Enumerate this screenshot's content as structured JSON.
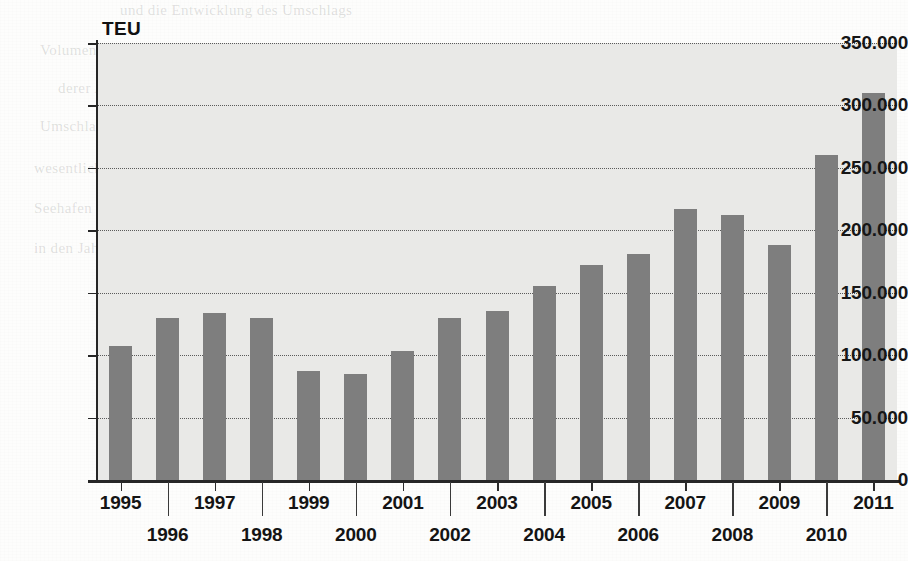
{
  "page": {
    "background_color": "#fdfdfc",
    "ghost_text_lines": [
      "und die Entwicklung des Umschlags",
      "Volumen haben an Bedeutung, und die Umschlagmenge stieg weiter",
      "derer Anteil an dem gesamten relativ zu Veränderungen",
      "Umschlag Hafen Bremen wesentlich gegenüber dem Vorjahr",
      "wesentlichen Anteil an der Zunahme der",
      "Seehafen und die Binnenschifffahrt",
      "in den Jahren"
    ]
  },
  "chart_data": {
    "type": "bar",
    "title": "",
    "subtitle": "",
    "xlabel": "",
    "ylabel": "TEU",
    "unit_label": "TEU",
    "categories": [
      "1995",
      "1996",
      "1997",
      "1998",
      "1999",
      "2000",
      "2001",
      "2002",
      "2003",
      "2004",
      "2005",
      "2006",
      "2007",
      "2008",
      "2009",
      "2010",
      "2011"
    ],
    "values": [
      107000,
      130000,
      134000,
      130000,
      87000,
      85000,
      103000,
      130000,
      135000,
      155000,
      172000,
      181000,
      217000,
      212000,
      188000,
      260000,
      310000
    ],
    "ylim": [
      0,
      350000
    ],
    "ytick_values": [
      0,
      50000,
      100000,
      150000,
      200000,
      250000,
      300000,
      350000
    ],
    "ytick_labels": [
      "0",
      "50.000",
      "100.000",
      "150.000",
      "200.000",
      "250.000",
      "300.000",
      "350.000"
    ],
    "grid": true,
    "grid_style": "dotted",
    "legend": "none",
    "bar_color": "#7e7e7e",
    "plot_background_color": "#e9e9e7",
    "axis_color": "#262626",
    "label_rows": [
      "top",
      "bottom",
      "top",
      "bottom",
      "top",
      "bottom",
      "top",
      "bottom",
      "top",
      "bottom",
      "top",
      "bottom",
      "top",
      "bottom",
      "top",
      "bottom",
      "top"
    ]
  }
}
